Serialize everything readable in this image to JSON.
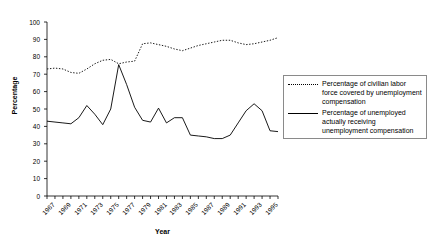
{
  "chart_data": {
    "type": "line",
    "title": "",
    "xlabel": "Year",
    "ylabel": "Percentage",
    "ylim": [
      0,
      100
    ],
    "ytick_step": 10,
    "yticks": [
      0,
      10,
      20,
      30,
      40,
      50,
      60,
      70,
      80,
      90,
      100
    ],
    "xlim": [
      1967,
      1996
    ],
    "x": [
      1967,
      1968,
      1969,
      1970,
      1971,
      1972,
      1973,
      1974,
      1975,
      1976,
      1977,
      1978,
      1979,
      1980,
      1981,
      1982,
      1983,
      1984,
      1985,
      1986,
      1987,
      1988,
      1989,
      1990,
      1991,
      1992,
      1993,
      1994,
      1995,
      1996
    ],
    "xtick_labels": [
      "1967",
      "1969",
      "1971",
      "1973",
      "1975",
      "1977",
      "1979",
      "1981",
      "1983",
      "1985",
      "1987",
      "1989",
      "1991",
      "1993",
      "1995"
    ],
    "xtick_values": [
      1967,
      1969,
      1971,
      1973,
      1975,
      1977,
      1979,
      1981,
      1983,
      1985,
      1987,
      1989,
      1991,
      1993,
      1995
    ],
    "grid": false,
    "legend_position": "right",
    "series": [
      {
        "name": "Percentage of civilian labor force covered by unemployment compensation",
        "style": "dotted",
        "color": "#000000",
        "values": [
          73,
          73.5,
          73,
          71,
          70.5,
          73,
          76,
          78,
          78.5,
          76,
          77,
          77.5,
          87.5,
          88,
          87,
          86,
          84.5,
          83.5,
          85,
          86.5,
          87.5,
          88.5,
          89.5,
          89.5,
          88,
          87,
          87.5,
          88.5,
          89.5,
          91
        ]
      },
      {
        "name": "Percentage of unemployed actually receiving unemployment compensation",
        "style": "solid",
        "color": "#000000",
        "values": [
          43,
          42.5,
          42,
          41.5,
          45,
          52,
          47,
          41,
          50,
          75.5,
          64,
          51,
          43.5,
          42.5,
          50.5,
          42,
          45,
          45,
          35,
          34.5,
          34,
          33,
          33,
          35,
          42,
          49,
          53,
          49,
          37.5,
          37
        ]
      }
    ]
  },
  "legend": {
    "entries": [
      {
        "swatch": "dotted-line-swatch",
        "label": "Percentage of civilian labor force covered by unemployment compensation"
      },
      {
        "swatch": "solid-line-swatch",
        "label": "Percentage of unemployed actually receiving unemployment compensation"
      }
    ]
  },
  "axes": {
    "y_title": "Percentage",
    "x_title": "Year"
  }
}
